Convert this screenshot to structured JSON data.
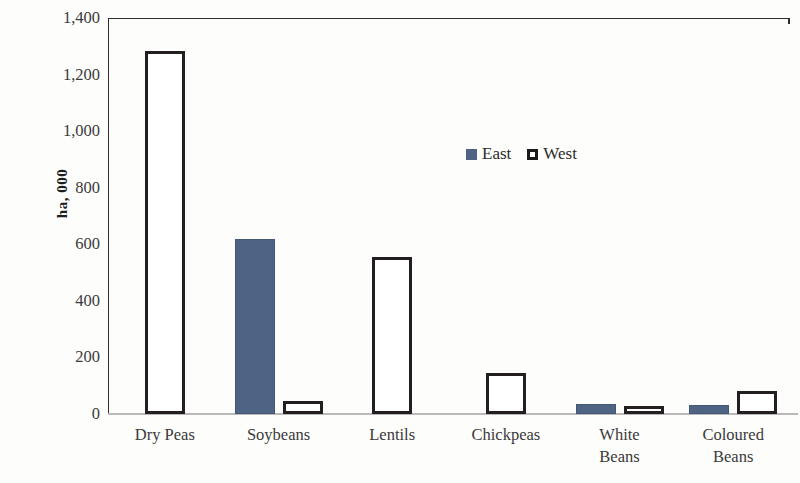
{
  "chart_data": {
    "type": "bar",
    "title": "",
    "subtitle": "",
    "xlabel": "",
    "ylabel": "ha, 000",
    "categories": [
      "Dry Peas",
      "Soybeans",
      "Lentils",
      "Chickpeas",
      "White Beans",
      "Coloured Beans"
    ],
    "category_lines": [
      [
        "Dry Peas"
      ],
      [
        "Soybeans"
      ],
      [
        "Lentils"
      ],
      [
        "Chickpeas"
      ],
      [
        "White",
        "Beans"
      ],
      [
        "Coloured",
        "Beans"
      ]
    ],
    "series": [
      {
        "name": "East",
        "color": "#4f6484",
        "values": [
          0,
          620,
          0,
          0,
          35,
          33
        ]
      },
      {
        "name": "West",
        "color": "#ffffff",
        "values": [
          1285,
          45,
          555,
          145,
          30,
          80
        ]
      }
    ],
    "ylim": [
      0,
      1400
    ],
    "yticks": [
      0,
      200,
      400,
      600,
      800,
      1000,
      1200,
      1400
    ],
    "ytick_labels": [
      "0",
      "200",
      "400",
      "600",
      "800",
      "1,000",
      "1,200",
      "1,400"
    ],
    "grid": false,
    "legend_position": "inside-upper-center",
    "legend": [
      "East",
      "West"
    ]
  },
  "legend": {
    "east_label": "East",
    "west_label": "West"
  },
  "colors": {
    "east_fill": "#4f6484",
    "west_fill": "#ffffff",
    "west_outline": "#231f20",
    "axis": "#2e2e2e",
    "text": "#2b2b2b"
  }
}
